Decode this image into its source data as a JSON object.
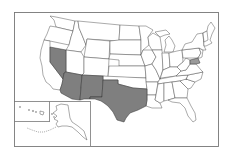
{
  "map": {
    "type": "choropleth",
    "region": "United States",
    "highlight_color": "#7f7f7f",
    "base_color": "#ffffff",
    "border_color": "#444444",
    "highlighted_states": [
      "Nevada",
      "Arizona",
      "New Mexico",
      "Texas"
    ],
    "insets": [
      "Hawaii",
      "Alaska"
    ]
  }
}
